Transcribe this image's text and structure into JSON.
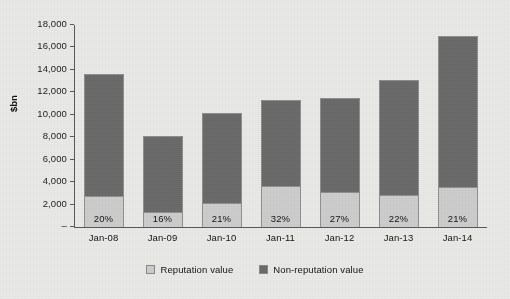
{
  "chart_data": {
    "type": "bar",
    "stacked": true,
    "title": "",
    "subtitle": "",
    "xlabel": "",
    "ylabel": "$bn",
    "ylim": [
      0,
      18000
    ],
    "ytick_values": [
      0,
      2000,
      4000,
      6000,
      8000,
      10000,
      12000,
      14000,
      16000,
      18000
    ],
    "ytick_labels": [
      "–",
      "2,000",
      "4,000",
      "6,000",
      "8,000",
      "10,000",
      "12,000",
      "14,000",
      "16,000",
      "18,000"
    ],
    "grid": false,
    "legend_position": "bottom",
    "categories": [
      "Jan-08",
      "Jan-09",
      "Jan-10",
      "Jan-11",
      "Jan-12",
      "Jan-13",
      "Jan-14"
    ],
    "series": [
      {
        "name": "Reputation value",
        "color": "#cdcdcd",
        "values": [
          2720,
          1300,
          2140,
          3630,
          3110,
          2880,
          3570
        ]
      },
      {
        "name": "Non-reputation value",
        "color": "#6b6b6b",
        "values": [
          10880,
          6800,
          8060,
          7720,
          8390,
          10220,
          13430
        ]
      }
    ],
    "totals": [
      13600,
      8100,
      10200,
      11350,
      11500,
      13100,
      17000
    ],
    "data_labels": [
      "20%",
      "16%",
      "21%",
      "32%",
      "27%",
      "22%",
      "21%"
    ],
    "annotations": []
  },
  "legend": {
    "items": [
      {
        "label": "Reputation value",
        "color": "#cdcdcd"
      },
      {
        "label": "Non-reputation value",
        "color": "#6b6b6b"
      }
    ]
  }
}
